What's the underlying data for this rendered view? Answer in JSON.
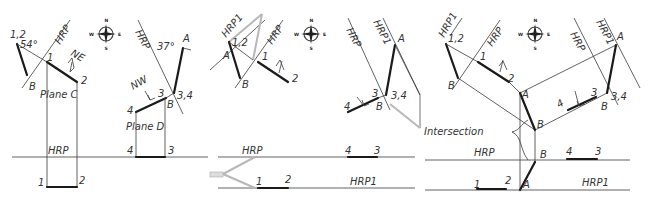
{
  "figure": {
    "panel1": {
      "plane_c": "Plane C",
      "plane_d": "Plane D",
      "hrp": "HRP",
      "angle_c": "54°",
      "angle_d": "37°",
      "dir_c": "NE",
      "dir_d": "NW",
      "pt_12": "1,2",
      "pt_1": "1",
      "pt_2": "2",
      "pt_b": "B",
      "pt_c": "C",
      "pt_3": "3",
      "pt_4": "4",
      "pt_34": "3,4",
      "pt_a": "A",
      "pt_d": "D"
    },
    "panel2": {
      "hrp": "HRP",
      "hrp1": "HRP1",
      "pt_a": "A",
      "pt_b": "B",
      "pt_12": "1,2",
      "pt_1": "1",
      "pt_2": "2",
      "pt_3": "3",
      "pt_4": "4",
      "pt_34": "3,4"
    },
    "panel3": {
      "hrp": "HRP",
      "hrp1": "HRP1",
      "intersection": "Intersection",
      "pt_a": "A",
      "pt_b": "B",
      "pt_12": "1,2",
      "pt_1": "1",
      "pt_2": "2",
      "pt_3": "3",
      "pt_4": "4",
      "pt_34": "3,4"
    },
    "compass": {
      "n": "N",
      "s": "S",
      "e": "E",
      "w": "W"
    }
  }
}
